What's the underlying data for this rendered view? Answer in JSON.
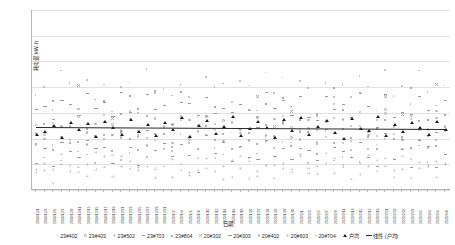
{
  "chart_data": {
    "type": "scatter",
    "title": "",
    "xlabel": "日期",
    "ylabel": "耗电量 kW·h",
    "ylim": [
      0,
      35
    ],
    "yticks": [
      0,
      5,
      10,
      15,
      20,
      25,
      30,
      35
    ],
    "grid": true,
    "legend_position": "bottom",
    "x": [
      "2019/12/1",
      "2019/12/3",
      "2019/12/5",
      "2019/12/7",
      "2019/12/9",
      "2019/12/11",
      "2019/12/13",
      "2019/12/15",
      "2019/12/17",
      "2019/12/19",
      "2019/12/21",
      "2019/12/23",
      "2019/12/25",
      "2019/12/27",
      "2019/12/29",
      "2019/12/31",
      "2020/1/2",
      "2020/1/4",
      "2020/1/6",
      "2020/1/8",
      "2020/1/10",
      "2020/1/12",
      "2020/1/14",
      "2020/1/16",
      "2020/1/18",
      "2020/1/20",
      "2020/1/22",
      "2020/1/24",
      "2020/1/26",
      "2020/1/28",
      "2020/1/30",
      "2020/2/1",
      "2020/2/3",
      "2020/2/5",
      "2020/2/7",
      "2020/2/9",
      "2020/2/11",
      "2020/2/13",
      "2020/2/15",
      "2020/2/17",
      "2020/2/19",
      "2020/2/21",
      "2020/2/23",
      "2020/2/25",
      "2020/2/27",
      "2020/3/2",
      "2020/3/4",
      "2020/3/6",
      "2020/3/8"
    ],
    "series": [
      {
        "name": "23#402",
        "marker": "dot",
        "color": "#b9b9b9",
        "values": [
          7.2,
          6.1,
          8.4,
          5.3,
          9.1,
          6.8,
          7.9,
          4.6,
          8.8,
          10.2,
          6.4,
          7.1,
          9.6,
          5.8,
          8.2,
          7.4,
          6.9,
          11.3,
          8.1,
          5.5,
          9.4,
          7.7,
          6.2,
          10.8,
          8.6,
          7.3,
          5.9,
          9.2,
          6.7,
          8.9,
          7.5,
          10.1,
          6.3,
          8.4,
          9.8,
          7.2,
          5.6,
          8.7,
          6.1,
          9.3,
          7.8,
          10.4,
          6.5,
          8.1,
          7.4,
          9.0,
          6.8,
          8.3,
          7.6
        ]
      },
      {
        "name": "23#403",
        "marker": "ring",
        "color": "#aeaeae",
        "values": [
          11.4,
          9.8,
          13.2,
          10.6,
          12.1,
          14.5,
          9.3,
          11.8,
          13.7,
          10.2,
          12.6,
          15.1,
          9.7,
          11.2,
          13.4,
          10.9,
          12.8,
          14.2,
          9.5,
          11.6,
          13.9,
          10.4,
          12.3,
          15.6,
          9.9,
          11.1,
          13.5,
          10.7,
          12.9,
          14.8,
          9.4,
          11.5,
          13.1,
          10.3,
          12.4,
          15.2,
          9.6,
          11.9,
          13.8,
          10.5,
          12.2,
          14.6,
          9.8,
          11.3,
          13.6,
          10.8,
          12.7,
          14.1,
          11.0
        ]
      },
      {
        "name": "23#502",
        "marker": "plus",
        "color": "#a9a9a9",
        "values": [
          4.3,
          5.6,
          3.8,
          6.2,
          4.9,
          5.1,
          3.4,
          6.8,
          4.5,
          5.9,
          3.9,
          6.4,
          4.1,
          5.3,
          3.6,
          6.6,
          4.8,
          5.2,
          3.7,
          6.1,
          4.4,
          5.8,
          3.5,
          6.9,
          4.7,
          5.4,
          3.3,
          6.3,
          4.2,
          5.7,
          3.8,
          6.5,
          4.6,
          5.0,
          3.9,
          6.7,
          4.1,
          5.5,
          3.4,
          6.2,
          4.9,
          5.3,
          3.7,
          6.0,
          4.5,
          5.6,
          3.6,
          6.4,
          4.8
        ]
      },
      {
        "name": "23#703",
        "marker": "dash",
        "color": "#9a9a9a",
        "values": [
          14.6,
          16.2,
          13.1,
          17.8,
          15.4,
          12.9,
          18.3,
          14.1,
          16.7,
          13.6,
          17.2,
          15.9,
          12.4,
          18.8,
          14.3,
          16.1,
          13.8,
          17.5,
          15.2,
          12.7,
          18.1,
          14.9,
          16.4,
          13.3,
          17.9,
          15.6,
          12.2,
          18.5,
          14.7,
          16.8,
          13.5,
          17.1,
          15.3,
          12.8,
          18.2,
          14.4,
          16.6,
          13.9,
          17.4,
          15.1,
          12.6,
          18.7,
          14.2,
          16.3,
          13.7,
          17.6,
          15.8,
          12.3,
          16.0
        ]
      },
      {
        "name": "23#804",
        "marker": "sq",
        "color": "#b2b2b2",
        "values": [
          9.4,
          11.2,
          8.1,
          12.6,
          10.3,
          7.8,
          13.1,
          9.7,
          11.5,
          8.4,
          12.2,
          10.8,
          7.5,
          13.6,
          9.2,
          11.9,
          8.7,
          12.4,
          10.1,
          7.3,
          13.3,
          9.9,
          11.4,
          8.2,
          12.8,
          10.6,
          7.7,
          13.8,
          9.5,
          11.7,
          8.9,
          12.1,
          10.4,
          7.4,
          13.2,
          9.8,
          11.3,
          8.6,
          12.7,
          10.2,
          7.9,
          13.5,
          9.1,
          11.6,
          8.3,
          12.9,
          10.7,
          7.6,
          11.1
        ]
      },
      {
        "name": "20#302",
        "marker": "x",
        "color": "#ababab",
        "values": [
          16.8,
          14.2,
          18.5,
          15.6,
          13.9,
          19.1,
          16.3,
          14.7,
          18.2,
          15.1,
          13.4,
          19.6,
          16.9,
          14.5,
          18.8,
          15.3,
          13.7,
          19.3,
          16.1,
          14.9,
          18.4,
          15.8,
          13.2,
          19.8,
          16.6,
          14.3,
          18.1,
          15.5,
          13.6,
          19.4,
          16.2,
          14.8,
          18.6,
          15.2,
          13.8,
          19.2,
          16.7,
          14.1,
          18.3,
          15.9,
          13.3,
          19.7,
          16.4,
          14.6,
          18.9,
          15.4,
          13.5,
          19.5,
          16.0
        ]
      },
      {
        "name": "20#303",
        "marker": "dash",
        "color": "#a4a4a4",
        "values": [
          6.4,
          8.1,
          5.2,
          9.3,
          7.6,
          4.8,
          10.1,
          6.9,
          8.4,
          5.5,
          9.7,
          7.2,
          4.4,
          10.6,
          6.2,
          8.8,
          5.9,
          9.1,
          7.8,
          4.6,
          10.3,
          6.7,
          8.2,
          5.3,
          9.8,
          7.4,
          4.2,
          10.8,
          6.5,
          8.6,
          5.7,
          9.4,
          7.1,
          4.9,
          10.2,
          6.8,
          8.3,
          5.4,
          9.6,
          7.7,
          4.5,
          10.5,
          6.3,
          8.9,
          5.8,
          9.2,
          7.3,
          4.7,
          8.0
        ]
      },
      {
        "name": "20#402",
        "marker": "ring",
        "color": "#b5b5b5",
        "values": [
          12.3,
          10.7,
          13.8,
          11.4,
          9.8,
          14.6,
          12.1,
          10.3,
          13.5,
          11.9,
          9.4,
          14.2,
          12.8,
          10.1,
          13.2,
          11.6,
          9.6,
          14.8,
          12.5,
          10.9,
          13.6,
          11.2,
          9.2,
          14.4,
          12.7,
          10.5,
          13.9,
          11.8,
          9.9,
          14.1,
          12.2,
          10.6,
          13.3,
          11.5,
          9.5,
          14.7,
          12.9,
          10.2,
          13.7,
          11.3,
          9.7,
          14.3,
          12.4,
          10.8,
          13.4,
          11.7,
          9.3,
          14.5,
          12.6
        ]
      },
      {
        "name": "20#603",
        "marker": "plus",
        "color": "#a7a7a7",
        "values": [
          3.2,
          4.6,
          2.8,
          5.3,
          3.9,
          2.4,
          5.8,
          3.5,
          4.9,
          2.6,
          5.5,
          3.7,
          2.2,
          6.1,
          3.1,
          4.4,
          2.9,
          5.2,
          3.8,
          2.5,
          5.9,
          3.4,
          4.7,
          2.7,
          5.6,
          3.6,
          2.3,
          6.2,
          3.3,
          4.8,
          2.8,
          5.4,
          3.9,
          2.6,
          5.7,
          3.2,
          4.5,
          2.4,
          5.3,
          3.7,
          2.9,
          6.0,
          3.5,
          4.3,
          2.7,
          5.1,
          3.8,
          2.5,
          4.2
        ]
      },
      {
        "name": "20#704",
        "marker": "dot",
        "color": "#bdbdbd",
        "values": [
          18.4,
          20.1,
          16.8,
          21.6,
          19.2,
          15.9,
          22.3,
          18.7,
          20.5,
          16.4,
          21.2,
          19.8,
          15.5,
          22.8,
          18.2,
          20.9,
          16.7,
          21.4,
          19.1,
          15.3,
          22.1,
          18.9,
          20.4,
          16.2,
          21.8,
          19.6,
          15.7,
          22.6,
          18.5,
          20.7,
          16.9,
          21.1,
          19.4,
          15.4,
          22.2,
          18.8,
          20.3,
          16.6,
          21.7,
          19.2,
          15.8,
          22.5,
          18.1,
          20.6,
          16.3,
          21.9,
          19.7,
          15.2,
          20.0
        ]
      },
      {
        "name": "户均",
        "marker": "triangle",
        "color": "#1d1d1d",
        "values": [
          10.8,
          11.4,
          12.6,
          10.2,
          13.1,
          11.7,
          12.9,
          10.5,
          13.4,
          12.2,
          10.9,
          13.8,
          11.3,
          12.7,
          10.6,
          13.2,
          11.8,
          14.1,
          10.4,
          12.5,
          13.6,
          11.1,
          12.3,
          14.4,
          10.7,
          11.9,
          13.3,
          12.1,
          10.3,
          13.7,
          11.6,
          14.2,
          10.8,
          12.4,
          13.5,
          11.2,
          10.1,
          13.9,
          12.0,
          11.5,
          14.3,
          10.6,
          12.8,
          11.4,
          13.1,
          12.2,
          10.9,
          13.4,
          11.7
        ]
      }
    ],
    "trendline": {
      "name": "线性 (户均)",
      "color": "#2a2a2a",
      "y_start": 12.3,
      "y_end": 11.9
    },
    "legend": [
      {
        "label": "23#402",
        "marker": "dot"
      },
      {
        "label": "23#403",
        "marker": "ring"
      },
      {
        "label": "23#502",
        "marker": "plus"
      },
      {
        "label": "23#703",
        "marker": "dash"
      },
      {
        "label": "23#804",
        "marker": "sq"
      },
      {
        "label": "20#302",
        "marker": "x"
      },
      {
        "label": "20#303",
        "marker": "dash"
      },
      {
        "label": "20#402",
        "marker": "ring"
      },
      {
        "label": "20#603",
        "marker": "plus"
      },
      {
        "label": "20#704",
        "marker": "dot"
      },
      {
        "label": "户均",
        "marker": "triangle"
      },
      {
        "label": "线性 (户均)",
        "marker": "line"
      }
    ]
  }
}
